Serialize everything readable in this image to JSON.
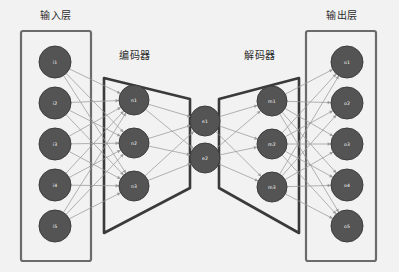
{
  "diagram": {
    "title_input": "输入层",
    "title_encoder": "编码器",
    "title_decoder": "解码器",
    "title_output": "输出层",
    "background_color": "#f2f2f2",
    "node_fill": "#545454",
    "node_stroke": "#3d3d3d",
    "edge_color": "#9a9a9a",
    "box_stroke": "#6b6b6b",
    "shape_stroke": "#3a3a3a",
    "label_color": "#2b2b2b"
  },
  "layers": {
    "input": {
      "name": "输入层",
      "nodes": [
        {
          "id": "i1",
          "label": "i1",
          "cx": 55,
          "cy": 62,
          "r": 16
        },
        {
          "id": "i2",
          "label": "i2",
          "cx": 55,
          "cy": 103,
          "r": 16
        },
        {
          "id": "i3",
          "label": "i3",
          "cx": 55,
          "cy": 144,
          "r": 16
        },
        {
          "id": "i4",
          "label": "i4",
          "cx": 55,
          "cy": 185,
          "r": 16
        },
        {
          "id": "i5",
          "label": "i5",
          "cx": 55,
          "cy": 226,
          "r": 16
        }
      ],
      "box": {
        "x": 21,
        "y": 31,
        "w": 70,
        "h": 230
      }
    },
    "encoder": {
      "name": "编码器",
      "nodes": [
        {
          "id": "n1",
          "label": "n1",
          "cx": 134,
          "cy": 100,
          "r": 15
        },
        {
          "id": "n2",
          "label": "n2",
          "cx": 134,
          "cy": 143,
          "r": 15
        },
        {
          "id": "n3",
          "label": "n3",
          "cx": 134,
          "cy": 186,
          "r": 15
        }
      ]
    },
    "bottleneck": {
      "nodes": [
        {
          "id": "e1",
          "label": "e1",
          "cx": 205,
          "cy": 121,
          "r": 15
        },
        {
          "id": "e2",
          "label": "e2",
          "cx": 205,
          "cy": 158,
          "r": 15
        }
      ]
    },
    "decoder": {
      "name": "解码器",
      "nodes": [
        {
          "id": "m1",
          "label": "m1",
          "cx": 272,
          "cy": 101,
          "r": 15
        },
        {
          "id": "m2",
          "label": "m2",
          "cx": 272,
          "cy": 144,
          "r": 15
        },
        {
          "id": "m3",
          "label": "m3",
          "cx": 272,
          "cy": 187,
          "r": 15
        }
      ]
    },
    "output": {
      "name": "输出层",
      "nodes": [
        {
          "id": "o1",
          "label": "o1",
          "cx": 347,
          "cy": 62,
          "r": 16
        },
        {
          "id": "o2",
          "label": "o2",
          "cx": 347,
          "cy": 103,
          "r": 16
        },
        {
          "id": "o3",
          "label": "o3",
          "cx": 347,
          "cy": 144,
          "r": 16
        },
        {
          "id": "o4",
          "label": "o4",
          "cx": 347,
          "cy": 185,
          "r": 16
        },
        {
          "id": "o5",
          "label": "o5",
          "cx": 347,
          "cy": 226,
          "r": 16
        }
      ],
      "box": {
        "x": 306,
        "y": 31,
        "w": 70,
        "h": 230
      }
    }
  },
  "labels_positions": {
    "input": {
      "x": 24,
      "y": 10,
      "w": 64
    },
    "encoder": {
      "x": 107,
      "y": 50,
      "w": 56
    },
    "decoder": {
      "x": 232,
      "y": 50,
      "w": 56
    },
    "output": {
      "x": 310,
      "y": 10,
      "w": 64
    }
  },
  "shapes": {
    "encoder_polygon": "104,78 190,99 190,188 104,233",
    "decoder_polygon": "219,99 299,78 299,233 219,188"
  },
  "connections": {
    "input_to_encoder": "fully-connected 5x3",
    "encoder_to_bottleneck": "fully-connected 3x2",
    "bottleneck_to_decoder": "fully-connected 2x3",
    "decoder_to_output": "fully-connected 3x5"
  }
}
